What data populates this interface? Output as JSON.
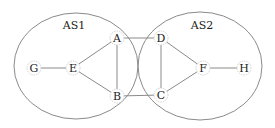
{
  "diagram": {
    "type": "network-topology",
    "autonomous_systems": [
      {
        "id": "AS1",
        "label": "AS1",
        "cx": 76,
        "cy": 66,
        "rx": 62,
        "ry": 53,
        "label_x": 74,
        "label_y": 25
      },
      {
        "id": "AS2",
        "label": "AS2",
        "cx": 200,
        "cy": 66,
        "rx": 62,
        "ry": 54,
        "label_x": 202,
        "label_y": 25
      }
    ],
    "nodes": [
      {
        "id": "G",
        "label": "G",
        "x": 34,
        "y": 68,
        "as": "AS1"
      },
      {
        "id": "E",
        "label": "E",
        "x": 73,
        "y": 68,
        "as": "AS1"
      },
      {
        "id": "A",
        "label": "A",
        "x": 117,
        "y": 38,
        "as": "AS1"
      },
      {
        "id": "B",
        "label": "B",
        "x": 117,
        "y": 96,
        "as": "AS1"
      },
      {
        "id": "D",
        "label": "D",
        "x": 161,
        "y": 38,
        "as": "AS2"
      },
      {
        "id": "C",
        "label": "C",
        "x": 161,
        "y": 95,
        "as": "AS2"
      },
      {
        "id": "F",
        "label": "F",
        "x": 203,
        "y": 68,
        "as": "AS2"
      },
      {
        "id": "H",
        "label": "H",
        "x": 244,
        "y": 68,
        "as": "AS2"
      }
    ],
    "edges": [
      {
        "from": "G",
        "to": "E"
      },
      {
        "from": "E",
        "to": "A"
      },
      {
        "from": "E",
        "to": "B"
      },
      {
        "from": "A",
        "to": "B"
      },
      {
        "from": "A",
        "to": "D"
      },
      {
        "from": "B",
        "to": "C"
      },
      {
        "from": "D",
        "to": "C"
      },
      {
        "from": "D",
        "to": "F"
      },
      {
        "from": "C",
        "to": "F"
      },
      {
        "from": "F",
        "to": "H"
      }
    ],
    "node_radius": 7
  }
}
